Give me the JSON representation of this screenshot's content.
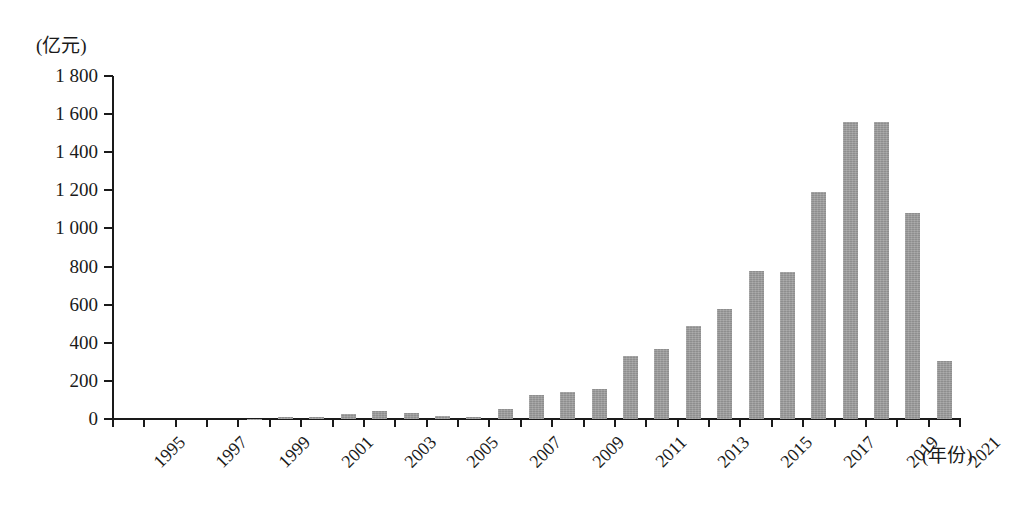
{
  "chart_data": {
    "type": "bar",
    "title": "",
    "subtitle": "",
    "xlabel": "(年份)",
    "ylabel": "(亿元)",
    "ylim": [
      0,
      1800
    ],
    "ytick_values": [
      0,
      200,
      400,
      600,
      800,
      1000,
      1200,
      1400,
      1600,
      1800
    ],
    "ytick_labels": [
      "0",
      "200",
      "400",
      "600",
      "800",
      "1 000",
      "1 200",
      "1 400",
      "1 600",
      "1 800"
    ],
    "grid": false,
    "legend": null,
    "bar_color": "#9c9c9c",
    "axis_color": "#1a1a1a",
    "background_color": "#ffffff",
    "categories": [
      "1995",
      "1996",
      "1997",
      "1998",
      "1999",
      "2000",
      "2001",
      "2002",
      "2003",
      "2004",
      "2005",
      "2006",
      "2007",
      "2008",
      "2009",
      "2010",
      "2011",
      "2012",
      "2013",
      "2014",
      "2015",
      "2016",
      "2017",
      "2018",
      "2019",
      "2020",
      "2021"
    ],
    "xtick_labels_shown": [
      "1995",
      "1997",
      "1999",
      "2001",
      "2003",
      "2005",
      "2007",
      "2009",
      "2011",
      "2013",
      "2015",
      "2017",
      "2019",
      "2021"
    ],
    "values": [
      0,
      0,
      0,
      0,
      2,
      8,
      12,
      28,
      42,
      32,
      18,
      12,
      50,
      125,
      143,
      157,
      331,
      368,
      489,
      578,
      775,
      770,
      1190,
      1560,
      1560,
      1080,
      305
    ]
  }
}
